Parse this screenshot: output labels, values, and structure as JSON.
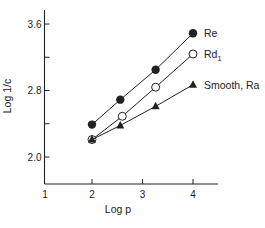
{
  "chart_data": {
    "type": "line",
    "title": "",
    "xlabel": "Log p",
    "ylabel": "Log 1/c",
    "xlim": [
      1,
      4.5
    ],
    "ylim": [
      1.67,
      3.75
    ],
    "x_ticks": [
      1,
      2,
      3,
      4
    ],
    "x_tick_labels": [
      "1",
      "2",
      "3",
      "4"
    ],
    "y_ticks": [
      2.0,
      2.4,
      2.8,
      3.2,
      3.6
    ],
    "y_tick_labels": [
      "2.0",
      "",
      "2.8",
      "",
      "3.6"
    ],
    "grid": false,
    "legend_position": "inline-right",
    "series": [
      {
        "name": "Re",
        "marker": "filled-circle",
        "x": [
          2.0,
          2.56,
          3.26,
          4.0
        ],
        "values": [
          2.39,
          2.69,
          3.05,
          3.49
        ]
      },
      {
        "name": "Rd",
        "name_subscript": "1",
        "marker": "open-circle",
        "x": [
          2.0,
          2.6,
          3.26,
          4.0
        ],
        "values": [
          2.21,
          2.49,
          2.84,
          3.24
        ]
      },
      {
        "name": "Smooth, Ra",
        "marker": "filled-triangle",
        "x": [
          2.0,
          2.56,
          3.26,
          4.0
        ],
        "values": [
          2.21,
          2.38,
          2.61,
          2.87
        ]
      }
    ]
  },
  "colors": {
    "ink": "#222222",
    "background": "#ffffff"
  }
}
